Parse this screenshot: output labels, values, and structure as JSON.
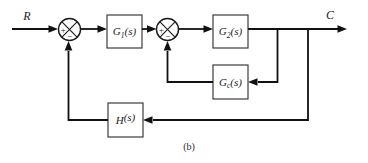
{
  "diagram": {
    "input_label": "R",
    "output_label": "C",
    "caption": "(b)",
    "blocks": {
      "g1": {
        "base": "G",
        "sub": "1",
        "args": "(s)"
      },
      "g2": {
        "base": "G",
        "sub": "2",
        "args": "(s)"
      },
      "gc": {
        "base": "G",
        "sub": "c",
        "args": "(s)"
      },
      "h": {
        "base": "H",
        "sub": "",
        "args": "(s)"
      }
    },
    "junctions": {
      "sum1": {
        "plus": "+",
        "minus": "−"
      },
      "sum2": {
        "plus": "+",
        "minus": "−"
      }
    },
    "colors": {
      "line": "#111111",
      "block_border": "#3d3d3d",
      "background": "#ffffff"
    }
  }
}
